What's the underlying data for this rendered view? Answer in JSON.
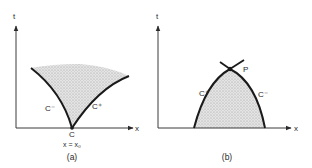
{
  "colors": {
    "ink": "#1a1a1a",
    "axis": "#3a3a3a",
    "shade": "#c9c9c9",
    "background": "#ffffff"
  },
  "panels": [
    {
      "id": "a",
      "caption": "(a)",
      "y_axis_label": "t",
      "x_axis_label": "x",
      "curves": [
        {
          "name": "C-",
          "label": "C⁻",
          "description": "left characteristic curving down to C"
        },
        {
          "name": "C+",
          "label": "C⁺",
          "description": "right characteristic rising from C"
        }
      ],
      "point_label": "C",
      "point_annotation": "x = x₀",
      "shaded_region": "fan between C- and C+ above point C"
    },
    {
      "id": "b",
      "caption": "(b)",
      "y_axis_label": "t",
      "x_axis_label": "x",
      "curves": [
        {
          "name": "C+",
          "label": "C⁺",
          "description": "left branch rising to P"
        },
        {
          "name": "C-",
          "label": "C⁻",
          "description": "right branch falling from P"
        }
      ],
      "point_label": "P",
      "shaded_region": "domain of dependence below P bounded by C+ and C-"
    }
  ]
}
